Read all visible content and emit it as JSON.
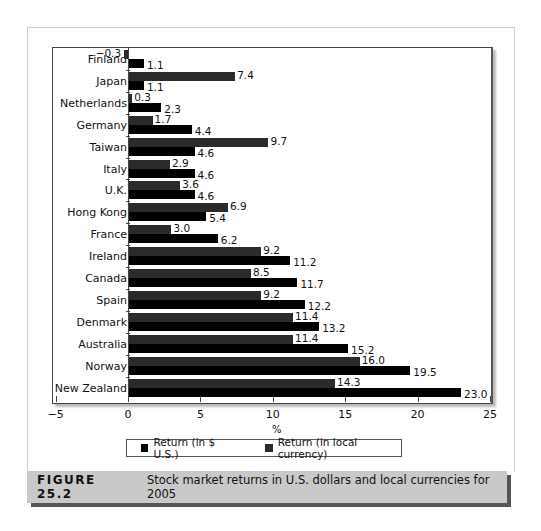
{
  "chart_data": {
    "type": "bar",
    "orientation": "horizontal",
    "title": "",
    "xlabel": "%",
    "ylabel": "",
    "xlim": [
      -5,
      25
    ],
    "xticks": [
      -5,
      0,
      5,
      10,
      15,
      20,
      25
    ],
    "grid": false,
    "legend_position": "bottom",
    "categories": [
      "Finland",
      "Japan",
      "Netherlands",
      "Germany",
      "Taiwan",
      "Italy",
      "U.K.",
      "Hong Kong",
      "France",
      "Ireland",
      "Canada",
      "Spain",
      "Denmark",
      "Australia",
      "Norway",
      "New Zealand"
    ],
    "series": [
      {
        "name": "Return (in local currency)",
        "color": "#2b2b2b",
        "values": [
          -0.3,
          7.4,
          0.3,
          1.7,
          9.7,
          2.9,
          3.6,
          6.9,
          3.0,
          9.2,
          8.5,
          9.2,
          11.4,
          11.4,
          16.0,
          14.3
        ]
      },
      {
        "name": "Return (in $ U.S.)",
        "color": "#000000",
        "values": [
          1.1,
          1.1,
          2.3,
          4.4,
          4.6,
          4.6,
          4.6,
          5.4,
          6.2,
          11.2,
          11.7,
          12.2,
          13.2,
          15.2,
          19.5,
          23.0
        ]
      }
    ]
  },
  "axis": {
    "x_tick_labels": [
      "−5",
      "0",
      "5",
      "10",
      "15",
      "20",
      "25"
    ],
    "unit": "%"
  },
  "legend": {
    "usd_label": "Return (in $ U.S.)",
    "usd_color": "#000000",
    "local_label": "Return (in local currency)",
    "local_color": "#2b2b2b"
  },
  "caption": {
    "figure_label": "FIGURE 25.2",
    "text": "Stock market returns in U.S. dollars and local currencies for 2005"
  }
}
